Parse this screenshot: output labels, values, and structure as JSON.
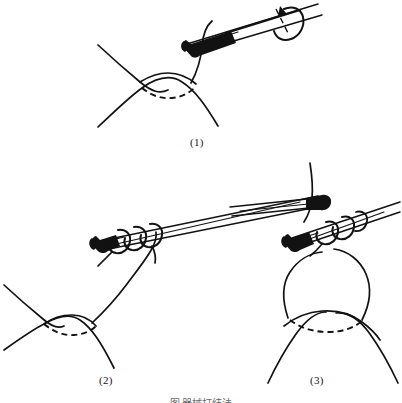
{
  "figure": {
    "title_alt": "Instrument tie knot technique — three step line drawing",
    "caption": "图  器械打结法",
    "caption_visible_fragment": "图  器械打结法",
    "background_color": "#ffffff",
    "ink_color": "#121212",
    "panels": [
      {
        "id": "panel-1",
        "label": "(1)",
        "description": "Suture strand looped once over the tip of the needle holder; curved arrow shows the wrapping rotation around the instrument shaft.",
        "elements": [
          "wound-edges",
          "wound-dashed-suture",
          "suture-strand",
          "needle-holder",
          "rotation-arrow"
        ]
      },
      {
        "id": "panel-2",
        "label": "(2)",
        "description": "Two to three throws of suture wound around the closed jaws of the needle holder, the free strand running down to the wound.",
        "elements": [
          "wound-edges",
          "wound-dashed-suture",
          "suture-strand",
          "needle-holder",
          "thread-coils"
        ]
      },
      {
        "id": "panel-3",
        "label": "(3)",
        "description": "The needle holder grasps the short end of the suture and the loops are drawn off the instrument to seat the knot over the wound.",
        "elements": [
          "wound-edges",
          "wound-dashed-suture",
          "suture-loop",
          "needle-holder-left",
          "needle-holder-right",
          "thread-coils"
        ]
      }
    ]
  },
  "labels": {
    "panel_1": "(1)",
    "panel_2": "(2)",
    "panel_3": "(3)"
  }
}
